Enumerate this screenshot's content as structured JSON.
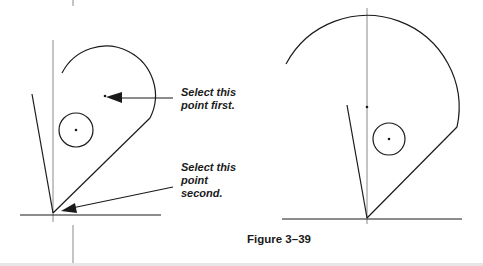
{
  "figure": {
    "caption": "Figure 3–39",
    "annotations": {
      "first": "Select this\npoint first.",
      "second": "Select this\npoint\nsecond."
    }
  },
  "colors": {
    "line": "#1a1a1a",
    "construction": "#8a8a8a",
    "background": "#ffffff"
  }
}
